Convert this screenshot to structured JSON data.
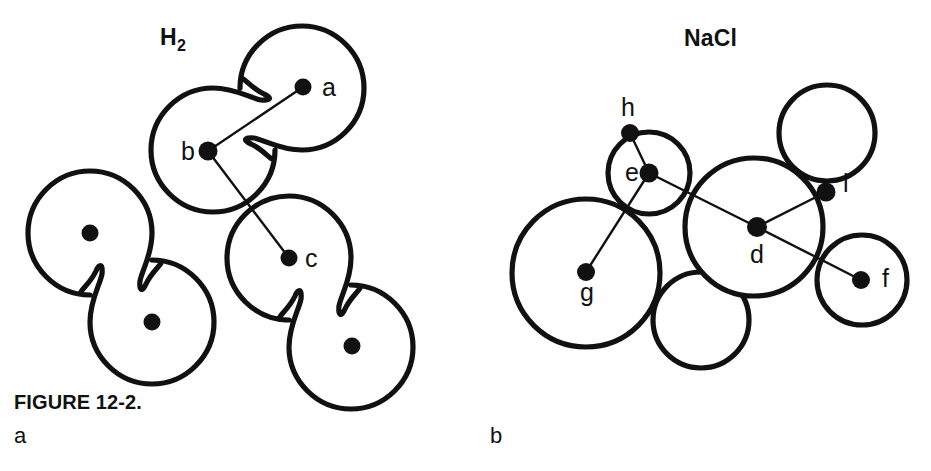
{
  "figure": {
    "caption": "FIGURE 12-2.",
    "background_color": "#ffffff",
    "ink_color": "#111111",
    "width": 931,
    "height": 471
  },
  "panels": [
    {
      "id": "a",
      "letter": "a",
      "title": "H",
      "title_subscript": "2",
      "title_full": "H2",
      "description": "Three dumbbell-shaped H2 molecule outlines with nuclei shown as filled dots; lines join nucleus a to nucleus b and nucleus b to nucleus c.",
      "labels": [
        {
          "id": "a",
          "text": "a",
          "x": 322,
          "y": 96
        },
        {
          "id": "b",
          "text": "b",
          "x": 181,
          "y": 160
        },
        {
          "id": "c",
          "text": "c",
          "x": 305,
          "y": 267
        }
      ],
      "molecules": [
        {
          "name": "top-right-molecule",
          "lobes": [
            {
              "cx": 302,
              "cy": 88,
              "r": 62
            },
            {
              "cx": 210,
              "cy": 152,
              "r": 62
            }
          ],
          "nuclei": [
            {
              "id": "a",
              "cx": 303,
              "cy": 87,
              "r": 8.5,
              "labeled": true
            },
            {
              "id": "b",
              "cx": 208,
              "cy": 151,
              "r": 9.5,
              "labeled": true
            }
          ]
        },
        {
          "name": "left-molecule",
          "lobes": [
            {
              "cx": 90,
              "cy": 233,
              "r": 62
            },
            {
              "cx": 152,
              "cy": 322,
              "r": 62
            }
          ],
          "nuclei": [
            {
              "id": "left-upper",
              "cx": 90,
              "cy": 233,
              "r": 8.5,
              "labeled": false
            },
            {
              "id": "left-lower",
              "cx": 152,
              "cy": 322,
              "r": 8.5,
              "labeled": false
            }
          ]
        },
        {
          "name": "bottom-right-molecule",
          "lobes": [
            {
              "cx": 289,
              "cy": 258,
              "r": 62
            },
            {
              "cx": 352,
              "cy": 346,
              "r": 62
            }
          ],
          "nuclei": [
            {
              "id": "c",
              "cx": 289,
              "cy": 258,
              "r": 8.5,
              "labeled": true
            },
            {
              "id": "br-lower",
              "cx": 352,
              "cy": 346,
              "r": 8.5,
              "labeled": false
            }
          ]
        }
      ],
      "bonds": [
        {
          "from": "a",
          "x1": 303,
          "y1": 87,
          "x2": 208,
          "y2": 151
        },
        {
          "from": "b",
          "x1": 208,
          "y1": 151,
          "x2": 289,
          "y2": 258
        }
      ]
    },
    {
      "id": "b",
      "letter": "b",
      "title": "NaCl",
      "title_subscript": "",
      "title_full": "NaCl",
      "description": "Packed circles of two sizes representing sodium and chloride ions; lines connect ion center d to ions e, i and f, and ion e to ions h and g.",
      "labels": [
        {
          "id": "h",
          "text": "h",
          "x": 621,
          "y": 116
        },
        {
          "id": "e",
          "text": "e",
          "x": 625,
          "y": 181
        },
        {
          "id": "i",
          "text": "i",
          "x": 843,
          "y": 192
        },
        {
          "id": "d",
          "text": "d",
          "x": 750,
          "y": 263
        },
        {
          "id": "f",
          "text": "f",
          "x": 882,
          "y": 287
        },
        {
          "id": "g",
          "text": "g",
          "x": 580,
          "y": 301
        }
      ],
      "ions": [
        {
          "id": "g-circle",
          "cx": 586,
          "cy": 273,
          "r": 74,
          "size": "large"
        },
        {
          "id": "d-circle",
          "cx": 754,
          "cy": 227,
          "r": 69,
          "size": "large"
        },
        {
          "id": "e-circle",
          "cx": 649,
          "cy": 173,
          "r": 41,
          "size": "small"
        },
        {
          "id": "top-right-circle",
          "cx": 827,
          "cy": 133,
          "r": 48,
          "size": "small"
        },
        {
          "id": "bottom-center-circle",
          "cx": 701,
          "cy": 320,
          "r": 48,
          "size": "small"
        },
        {
          "id": "f-circle",
          "cx": 862,
          "cy": 280,
          "r": 45,
          "size": "small"
        }
      ],
      "centers": [
        {
          "id": "h",
          "cx": 630,
          "cy": 133,
          "r": 9,
          "labeled": true
        },
        {
          "id": "e",
          "cx": 649,
          "cy": 173,
          "r": 9.5,
          "labeled": true
        },
        {
          "id": "i",
          "cx": 826,
          "cy": 192,
          "r": 9.5,
          "labeled": true
        },
        {
          "id": "d",
          "cx": 757,
          "cy": 227,
          "r": 10,
          "labeled": true
        },
        {
          "id": "f",
          "cx": 861,
          "cy": 280,
          "r": 9,
          "labeled": true
        },
        {
          "id": "g",
          "cx": 586,
          "cy": 272,
          "r": 9,
          "labeled": true
        }
      ],
      "bonds": [
        {
          "from": "e",
          "to": "h",
          "x1": 649,
          "y1": 173,
          "x2": 630,
          "y2": 133
        },
        {
          "from": "e",
          "to": "g",
          "x1": 649,
          "y1": 173,
          "x2": 586,
          "y2": 272
        },
        {
          "from": "e",
          "to": "d",
          "x1": 649,
          "y1": 173,
          "x2": 757,
          "y2": 227
        },
        {
          "from": "d",
          "to": "i",
          "x1": 757,
          "y1": 227,
          "x2": 826,
          "y2": 192
        },
        {
          "from": "d",
          "to": "f",
          "x1": 757,
          "y1": 227,
          "x2": 861,
          "y2": 280
        },
        {
          "from": "i",
          "to": "f-arc",
          "x1": 826,
          "y1": 192,
          "x2": 843,
          "y2": 243
        }
      ]
    }
  ]
}
